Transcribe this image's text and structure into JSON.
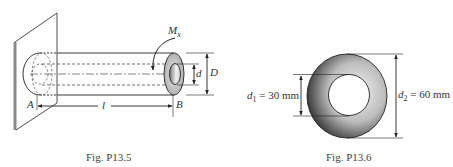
{
  "figures": [
    {
      "id": "fig1",
      "caption": "Fig. P13.5",
      "labels": {
        "moment": "M",
        "moment_sub": "x",
        "inner_diameter": "d",
        "outer_diameter": "D",
        "end_a": "A",
        "end_b": "B",
        "length": "l"
      }
    },
    {
      "id": "fig2",
      "caption": "Fig. P13.6",
      "labels": {
        "d1_var": "d",
        "d1_sub": "1",
        "d1_value": " = 30 mm",
        "d2_var": "d",
        "d2_sub": "2",
        "d2_value": " = 60 mm"
      }
    }
  ],
  "colors": {
    "line": "#222222",
    "wall_edge": "#888888",
    "ring_fill": "#bdbdbd",
    "annulus_dark": "#3a3a3a",
    "annulus_light": "#f2f2f2"
  }
}
